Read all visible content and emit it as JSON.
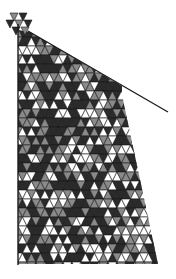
{
  "figure": {
    "colors": {
      "background": "#ffffff",
      "stroke": "#1a1a1a",
      "dark_fill": "#2b2b2b",
      "mid_fill": "#8a8a8a",
      "light_fill": "#ffffff"
    }
  }
}
